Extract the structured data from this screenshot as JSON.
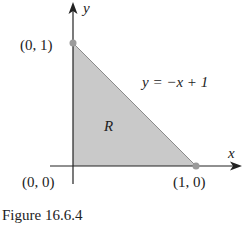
{
  "figure": {
    "caption": "Figure 16.6.4",
    "region_label": "R",
    "equation_label": "y = −x  + 1",
    "axes": {
      "x_label": "x",
      "y_label": "y"
    },
    "points": [
      {
        "label": "(0, 1)",
        "x": 0,
        "y": 1
      },
      {
        "label": "(0, 0)",
        "x": 0,
        "y": 0
      },
      {
        "label": "(1, 0)",
        "x": 1,
        "y": 0
      }
    ],
    "colors": {
      "region_fill": "#c9c9c9",
      "axis": "#222222",
      "point": "#9a9a9a",
      "boundary": "#8a8a8a"
    }
  }
}
